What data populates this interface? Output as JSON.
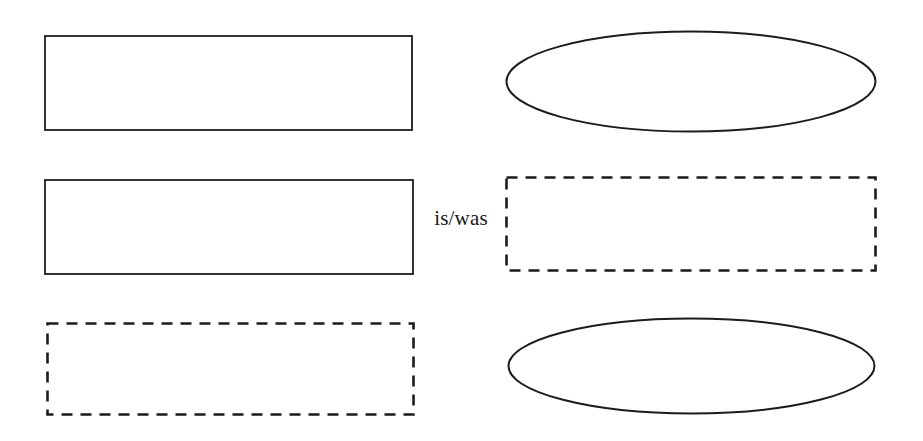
{
  "diagram": {
    "relation_label": "is/was",
    "colors": {
      "stroke": "#1c1c1c",
      "background": "#ffffff"
    },
    "left_column": [
      {
        "shape": "rectangle",
        "outline": "solid"
      },
      {
        "shape": "rectangle",
        "outline": "solid"
      },
      {
        "shape": "rectangle",
        "outline": "dashed"
      }
    ],
    "right_column": [
      {
        "shape": "ellipse",
        "outline": "solid"
      },
      {
        "shape": "rectangle",
        "outline": "dashed"
      },
      {
        "shape": "ellipse",
        "outline": "solid"
      }
    ]
  }
}
